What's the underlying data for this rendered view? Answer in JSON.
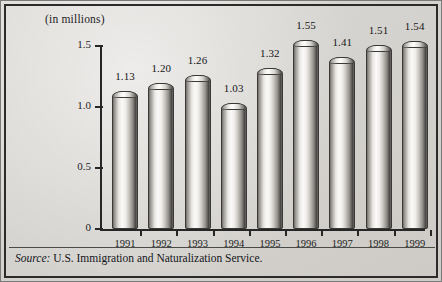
{
  "chart_data": {
    "type": "bar",
    "title": "(in millions)",
    "xlabel": "",
    "ylabel": "",
    "categories": [
      "1991",
      "1992",
      "1993",
      "1994",
      "1995",
      "1996",
      "1997",
      "1998",
      "1999"
    ],
    "values": [
      1.13,
      1.2,
      1.26,
      1.03,
      1.32,
      1.55,
      1.41,
      1.51,
      1.54
    ],
    "value_labels": [
      "1.13",
      "1.20",
      "1.26",
      "1.03",
      "1.32",
      "1.55",
      "1.41",
      "1.51",
      "1.54"
    ],
    "ylim": [
      0,
      1.5
    ],
    "yticks": [
      0,
      0.5,
      1.0,
      1.5
    ],
    "ytick_labels": [
      "0",
      "0.5",
      "1.0",
      "1.5"
    ],
    "grid": false,
    "legend": null,
    "series": [
      {
        "name": "Legal immigrants admitted",
        "values": [
          1.13,
          1.2,
          1.26,
          1.03,
          1.32,
          1.55,
          1.41,
          1.51,
          1.54
        ]
      }
    ]
  },
  "footer": {
    "source_word": "Source:",
    "source_text": " U.S. Immigration and Naturalization Service."
  },
  "colors": {
    "background": "#d5d3cf",
    "frame": "#2b2b2b",
    "axis": "#262626",
    "text": "#1d1d1d",
    "bar_light": "#fbfaf8",
    "bar_dark": "#4a4846"
  }
}
